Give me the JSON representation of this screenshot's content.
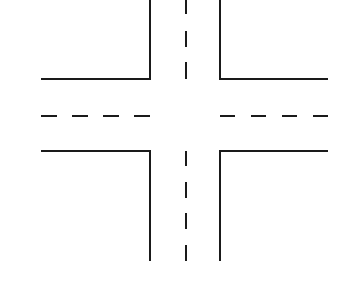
{
  "diagram": {
    "title": "",
    "type": "four-way intersection",
    "colors": {
      "background": "#ffffff",
      "line": "#1a1a1a"
    },
    "curbs": [
      {
        "name": "top-left-curb",
        "points": [
          [
            41,
            79
          ],
          [
            150,
            79
          ],
          [
            150,
            0
          ]
        ]
      },
      {
        "name": "top-right-curb",
        "points": [
          [
            220,
            0
          ],
          [
            220,
            79
          ],
          [
            328,
            79
          ]
        ]
      },
      {
        "name": "bottom-left-curb",
        "points": [
          [
            41,
            151
          ],
          [
            150,
            151
          ],
          [
            150,
            261
          ]
        ]
      },
      {
        "name": "bottom-right-curb",
        "points": [
          [
            220,
            261
          ],
          [
            220,
            151
          ],
          [
            328,
            151
          ]
        ]
      }
    ],
    "center_lines": {
      "horizontal_left": [
        [
          41,
          57
        ],
        [
          72,
          88
        ],
        [
          103,
          119
        ],
        [
          134,
          150
        ]
      ],
      "horizontal_right": [
        [
          220,
          235
        ],
        [
          251,
          266
        ],
        [
          282,
          297
        ],
        [
          313,
          328
        ]
      ],
      "horizontal_y": 116,
      "vertical_top": [
        [
          0,
          14
        ],
        [
          31,
          47
        ],
        [
          62,
          79
        ]
      ],
      "vertical_bottom": [
        [
          151,
          166
        ],
        [
          182,
          198
        ],
        [
          213,
          229
        ],
        [
          245,
          261
        ]
      ],
      "vertical_x": 186
    }
  }
}
